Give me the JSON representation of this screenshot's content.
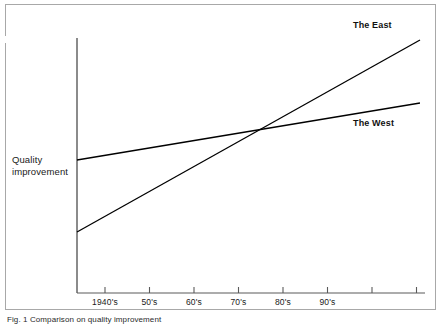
{
  "figure": {
    "caption": "Fig. 1  Comparison on quality improvement",
    "y_axis_label_line1": "Quality",
    "y_axis_label_line2": "improvement"
  },
  "chart_data": {
    "type": "line",
    "title": "",
    "subtitle": "",
    "xlabel": "",
    "ylabel": "Quality improvement",
    "grid": false,
    "legend_position": "inline-right",
    "x_axis": {
      "tick_labels": [
        "1940's",
        "50's",
        "60's",
        "70's",
        "80's",
        "90's",
        "",
        ""
      ],
      "tick_count": 8,
      "labeled_tick_count": 6
    },
    "y_axis": {
      "tick_labels": [],
      "scale": "qualitative",
      "note": "no numeric scale shown"
    },
    "categories": [
      "1940's",
      "50's",
      "60's",
      "70's",
      "80's",
      "90's"
    ],
    "series": [
      {
        "name": "The East",
        "values": [
          12,
          26,
          40,
          54,
          68,
          82
        ],
        "start_value": 12,
        "end_value": 95,
        "trend": "steep-rise"
      },
      {
        "name": "The West",
        "values": [
          45,
          51,
          57,
          63,
          69,
          75
        ],
        "start_value": 45,
        "end_value": 80,
        "trend": "gentle-rise"
      }
    ],
    "annotations": [
      {
        "text": "crossover point",
        "near_category": "80's"
      }
    ],
    "colors": {
      "line": "#000000",
      "axis": "#555555",
      "frame": "#a8a8a8",
      "background": "#ffffff"
    }
  }
}
